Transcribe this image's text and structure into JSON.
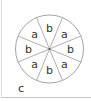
{
  "diagram": {
    "type": "circle-sectors",
    "sector_count": 8,
    "sectors": [
      {
        "label": "b"
      },
      {
        "label": "a"
      },
      {
        "label": "b"
      },
      {
        "label": "a"
      },
      {
        "label": "b"
      },
      {
        "label": "a"
      },
      {
        "label": "b"
      },
      {
        "label": "a"
      }
    ],
    "corner_label": "c",
    "colors": {
      "stroke": "#9a9a9a",
      "text": "#333333",
      "background": "#ffffff"
    }
  }
}
